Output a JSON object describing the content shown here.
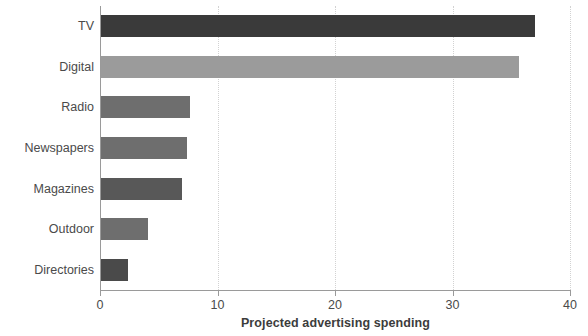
{
  "chart_data": {
    "type": "bar",
    "orientation": "horizontal",
    "title": "",
    "xlabel": "Projected advertising spending",
    "ylabel": "Medium",
    "categories": [
      "TV",
      "Digital",
      "Radio",
      "Newspapers",
      "Magazines",
      "Outdoor",
      "Directories"
    ],
    "values": [
      37.0,
      35.7,
      7.7,
      7.4,
      7.0,
      4.1,
      2.4
    ],
    "bar_colors": [
      "#3a3a3a",
      "#9b9b9b",
      "#6e6e6e",
      "#6e6e6e",
      "#585858",
      "#6e6e6e",
      "#4a4a4a"
    ],
    "xlim": [
      0,
      40
    ],
    "xticks": [
      0,
      10,
      20,
      30,
      40
    ],
    "xtick_labels": [
      "0",
      "10",
      "20",
      "30",
      "40"
    ],
    "grid": "vertical-dotted",
    "legend": "none",
    "background": "#ffffff",
    "axis_color": "#9a9a9a",
    "grid_color": "#d2d2d2"
  },
  "axes": {
    "x_title": "Projected advertising spending",
    "y_title": "Medium"
  }
}
